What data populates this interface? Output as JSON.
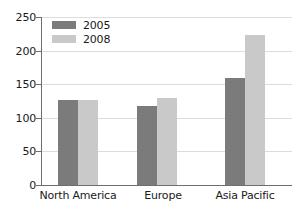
{
  "chart_data": {
    "type": "bar",
    "title": "",
    "subtitle": "",
    "xlabel": "",
    "ylabel": "",
    "categories": [
      "North America",
      "Europe",
      "Asia Pacific"
    ],
    "series": [
      {
        "name": "2005",
        "color": "#7b7b7b",
        "values": [
          126,
          118,
          159
        ]
      },
      {
        "name": "2008",
        "color": "#c9c9c9",
        "values": [
          126,
          129,
          223
        ]
      }
    ],
    "ylim": [
      0,
      250
    ],
    "yticks": [
      0,
      50,
      100,
      150,
      200,
      250
    ],
    "ytick_labels": [
      "0",
      "50",
      "100",
      "150",
      "200",
      "250"
    ],
    "grid": true,
    "legend_position": "top-left",
    "annotations": []
  },
  "legend": {
    "entries": [
      {
        "label": "2005"
      },
      {
        "label": "2008"
      }
    ]
  },
  "axis": {
    "y_labels": [
      "250",
      "200",
      "150",
      "100",
      "50",
      "0"
    ],
    "x_labels": [
      "North America",
      "Europe",
      "Asia Pacific"
    ]
  }
}
